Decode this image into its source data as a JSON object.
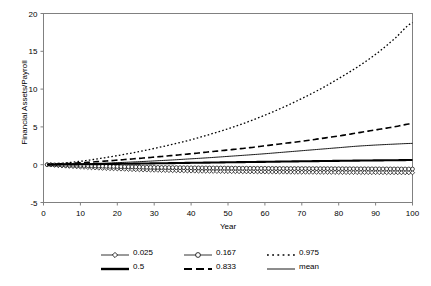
{
  "chart_data": {
    "type": "line",
    "title": "",
    "xlabel": "Year",
    "ylabel": "Financial Assets/Payroll",
    "xlim": [
      0,
      100
    ],
    "ylim": [
      -5,
      20
    ],
    "xticks": [
      0,
      10,
      20,
      30,
      40,
      50,
      60,
      70,
      80,
      90,
      100
    ],
    "yticks": [
      -5,
      0,
      5,
      10,
      15,
      20
    ],
    "xtick_labels": [
      "0",
      "10",
      "20",
      "30",
      "40",
      "50",
      "60",
      "70",
      "80",
      "90",
      "100"
    ],
    "ytick_labels": [
      "-5",
      "0",
      "5",
      "10",
      "15",
      "20"
    ],
    "grid": false,
    "legend_position": "bottom",
    "x": [
      1,
      5,
      10,
      15,
      20,
      25,
      30,
      35,
      40,
      45,
      50,
      55,
      60,
      65,
      70,
      75,
      80,
      85,
      90,
      95,
      100
    ],
    "series": [
      {
        "name": "0.025",
        "label": "0.025",
        "style": "marker-diamond",
        "color": "#000000",
        "values": [
          0.0,
          -0.15,
          -0.3,
          -0.45,
          -0.55,
          -0.65,
          -0.72,
          -0.78,
          -0.83,
          -0.87,
          -0.9,
          -0.93,
          -0.95,
          -0.97,
          -0.99,
          -1.0,
          -1.02,
          -1.03,
          -1.04,
          -1.05,
          -1.06
        ]
      },
      {
        "name": "0.167",
        "label": "0.167",
        "style": "marker-circle",
        "color": "#000000",
        "values": [
          0.0,
          -0.05,
          -0.1,
          -0.18,
          -0.25,
          -0.3,
          -0.35,
          -0.38,
          -0.41,
          -0.43,
          -0.45,
          -0.47,
          -0.48,
          -0.5,
          -0.51,
          -0.52,
          -0.53,
          -0.54,
          -0.55,
          -0.56,
          -0.57
        ]
      },
      {
        "name": "0.975",
        "label": "0.975",
        "style": "dotted",
        "color": "#000000",
        "values": [
          0.05,
          0.2,
          0.45,
          0.8,
          1.2,
          1.65,
          2.15,
          2.7,
          3.3,
          4.0,
          4.75,
          5.6,
          6.55,
          7.6,
          8.75,
          10.0,
          11.4,
          12.9,
          14.6,
          16.6,
          18.8
        ]
      },
      {
        "name": "0.5",
        "label": "0.5",
        "style": "solid-thick",
        "color": "#000000",
        "values": [
          0.0,
          0.02,
          0.05,
          0.08,
          0.11,
          0.14,
          0.18,
          0.21,
          0.25,
          0.28,
          0.32,
          0.35,
          0.38,
          0.42,
          0.45,
          0.48,
          0.51,
          0.54,
          0.57,
          0.59,
          0.62
        ]
      },
      {
        "name": "0.833",
        "label": "0.833",
        "style": "dashed",
        "color": "#000000",
        "values": [
          0.03,
          0.12,
          0.25,
          0.42,
          0.6,
          0.8,
          1.0,
          1.22,
          1.45,
          1.7,
          1.95,
          2.2,
          2.5,
          2.8,
          3.1,
          3.45,
          3.8,
          4.2,
          4.6,
          5.0,
          5.45
        ]
      },
      {
        "name": "mean",
        "label": "mean",
        "style": "solid-thin",
        "color": "#000000",
        "values": [
          0.0,
          0.04,
          0.1,
          0.18,
          0.27,
          0.38,
          0.5,
          0.63,
          0.78,
          0.93,
          1.1,
          1.27,
          1.45,
          1.65,
          1.85,
          2.05,
          2.25,
          2.45,
          2.6,
          2.72,
          2.82
        ]
      }
    ]
  },
  "legend": {
    "rows": [
      [
        {
          "label": "0.025",
          "style": "marker-diamond"
        },
        {
          "label": "0.167",
          "style": "marker-circle"
        },
        {
          "label": "0.975",
          "style": "dotted"
        }
      ],
      [
        {
          "label": "0.5",
          "style": "solid-thick"
        },
        {
          "label": "0.833",
          "style": "dashed"
        },
        {
          "label": "mean",
          "style": "solid-thin"
        }
      ]
    ]
  },
  "colors": {
    "line": "#000000",
    "axis": "#808080",
    "background": "#ffffff"
  }
}
